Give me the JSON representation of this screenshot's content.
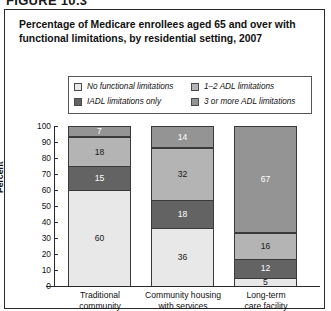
{
  "figure": {
    "number_label": "FIGURE 10.3"
  },
  "title": {
    "line1": "Percentage of Medicare enrollees aged 65 and over with",
    "line2": "functional limitations, by residential setting, 2007"
  },
  "legend": {
    "items": [
      {
        "label": "No functional limitations",
        "color": "#e8e8e8"
      },
      {
        "label": "1–2 ADL limitations",
        "color": "#b4b4b4"
      },
      {
        "label": "IADL limitations only",
        "color": "#636363"
      },
      {
        "label": "3 or more ADL limitations",
        "color": "#949494"
      }
    ]
  },
  "axes": {
    "y_label": "Percent",
    "y_ticks": [
      "100",
      "90",
      "80",
      "70",
      "60",
      "50",
      "40",
      "30",
      "20",
      "10",
      "0"
    ]
  },
  "chart_data": {
    "type": "bar",
    "title": "Percentage of Medicare enrollees aged 65 and over with functional limitations, by residential setting, 2007",
    "xlabel": "",
    "ylabel": "Percent",
    "ylim": [
      0,
      100
    ],
    "grid": false,
    "stacked": true,
    "legend_position": "top",
    "categories": [
      "Traditional community",
      "Community housing with services",
      "Long-term care facility"
    ],
    "category_lines": [
      [
        "Traditional",
        "community"
      ],
      [
        "Community housing",
        "with services"
      ],
      [
        "Long-term",
        "care facility"
      ]
    ],
    "series": [
      {
        "name": "No functional limitations",
        "color": "#e8e8e8",
        "values": [
          60,
          36,
          5
        ]
      },
      {
        "name": "IADL limitations only",
        "color": "#636363",
        "values": [
          15,
          18,
          12
        ]
      },
      {
        "name": "1–2 ADL limitations",
        "color": "#b4b4b4",
        "values": [
          18,
          32,
          16
        ]
      },
      {
        "name": "3 or more ADL limitations",
        "color": "#949494",
        "values": [
          7,
          14,
          67
        ]
      }
    ]
  }
}
